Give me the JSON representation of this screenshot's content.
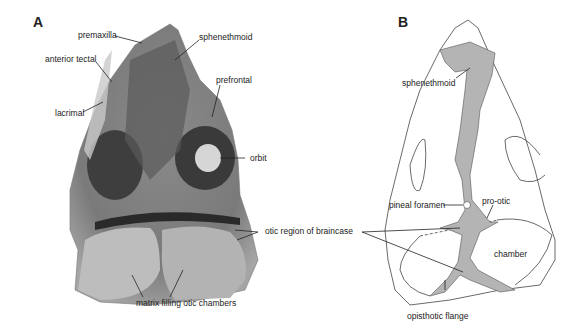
{
  "panels": {
    "a": {
      "letter": "A",
      "labels": {
        "premaxilla": "premaxilla",
        "anterior_tectal": "anterior tectal",
        "lacrimal": "lacrimal",
        "sphenethmoid": "sphenethmoid",
        "prefrontal": "prefrontal",
        "orbit": "orbit",
        "otic_region": "otic region of braincase",
        "matrix": "matrix filling otic chambers"
      }
    },
    "b": {
      "letter": "B",
      "labels": {
        "sphenethmoid": "sphenethmoid",
        "pineal_foramen": "pineal foramen",
        "pro_otic": "pro-otic",
        "chamber": "chamber",
        "opisthotic_flange": "opisthotic flange"
      }
    }
  },
  "colors": {
    "fossil_light": "#b8b8b8",
    "fossil_dark": "#4a4a4a",
    "braincase_fill": "#b4b4b4",
    "outline": "#333333"
  }
}
